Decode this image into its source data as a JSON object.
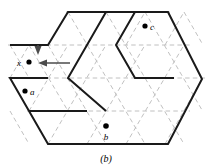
{
  "figure": {
    "caption": "(b)",
    "canvas": {
      "width": 213,
      "height": 166,
      "background": "#ffffff"
    },
    "colors": {
      "outline": "#1a1a1a",
      "grid": "#b9b9b9",
      "arrow": "#4b4b4b",
      "dot": "#000000",
      "text": "#000000"
    },
    "points": [
      {
        "id": "x",
        "label": "x",
        "label_position": "left",
        "cx": 29,
        "cy": 62
      },
      {
        "id": "a",
        "label": "a",
        "label_position": "right",
        "cx": 25,
        "cy": 91
      },
      {
        "id": "b",
        "label": "b",
        "label_position": "below",
        "cx": 106,
        "cy": 126
      },
      {
        "id": "c",
        "label": "c",
        "label_position": "right",
        "cx": 145,
        "cy": 26
      }
    ],
    "arrows": [
      {
        "id": "translation-arrow",
        "direction": "left",
        "x1": 68,
        "y1": 63,
        "x2": 38,
        "y2": 63
      },
      {
        "id": "corner-arrow",
        "direction": "down",
        "x1": 38,
        "y1": 44,
        "x2": 38,
        "y2": 52
      }
    ],
    "grid": {
      "type": "triangular",
      "dashed": true,
      "spacing_x": 39.5,
      "spacing_y": 33.0
    },
    "region_outline_path": "M 10 45 L 48 45 L 68 12 L 82 12 L 82 12 L 135 12 L 168 12 L 187 45 L 202 79 L 187 111 L 168 144 L 48 144 L 29 111 L 10 78 L 48 78 L 48 78",
    "outline_description": "hexagonal region with stepped boundary",
    "cut_description": "interior zigzag dissection path"
  }
}
